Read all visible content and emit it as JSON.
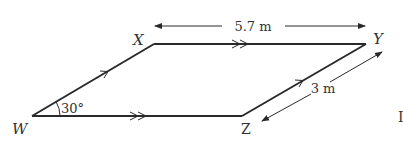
{
  "diagram": {
    "type": "parallelogram",
    "vertices": {
      "W": {
        "label": "W"
      },
      "X": {
        "label": "X"
      },
      "Y": {
        "label": "Y"
      },
      "Z": {
        "label": "Z"
      }
    },
    "angle_label": "30°",
    "top_dimension": "5.7 m",
    "side_dimension": "3 m",
    "edge_color": "#2a2a2a",
    "text_color": "#333333",
    "parallel_marks": {
      "WX": "single",
      "ZY": "single",
      "XY": "double",
      "WZ": "double"
    },
    "edge_fragment": "I"
  }
}
